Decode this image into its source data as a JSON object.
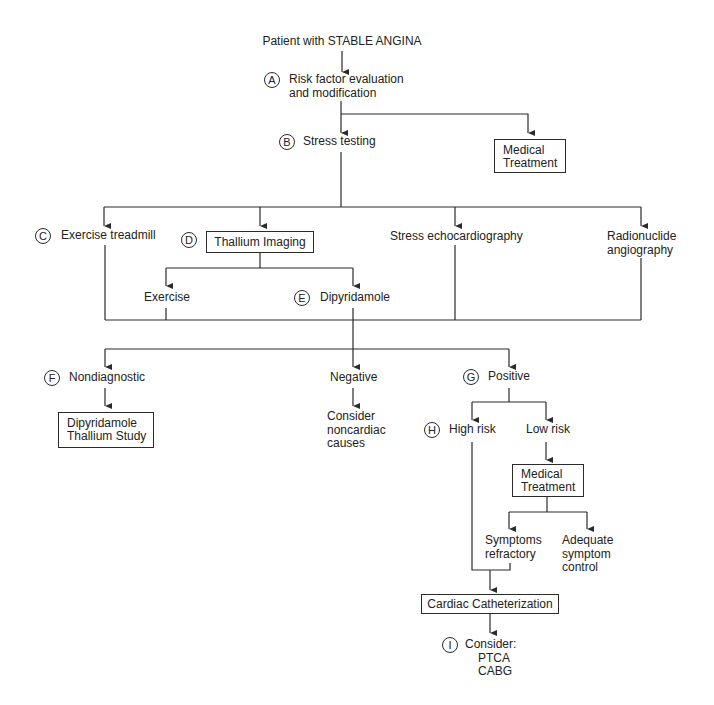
{
  "title": "Patient with STABLE ANGINA",
  "nodes": {
    "a": {
      "marker": "A",
      "label": "Risk factor evaluation\nand modification"
    },
    "medical_treatment_1": {
      "label": "Medical\nTreatment"
    },
    "b": {
      "marker": "B",
      "label": "Stress testing"
    },
    "c": {
      "marker": "C",
      "label": "Exercise treadmill"
    },
    "d": {
      "marker": "D",
      "label": "Thallium Imaging"
    },
    "stress_echo": {
      "label": "Stress echocardiography"
    },
    "radionuclide": {
      "label": "Radionuclide\nangiography"
    },
    "exercise": {
      "label": "Exercise"
    },
    "e": {
      "marker": "E",
      "label": "Dipyridamole"
    },
    "f": {
      "marker": "F",
      "label": "Nondiagnostic"
    },
    "dipyridamole_study": {
      "label": "Dipyridamole\nThallium Study"
    },
    "negative": {
      "label": "Negative"
    },
    "noncardiac": {
      "label": "Consider\nnoncardiac\ncauses"
    },
    "g": {
      "marker": "G",
      "label": "Positive"
    },
    "h": {
      "marker": "H",
      "label": "High risk"
    },
    "low_risk": {
      "label": "Low risk"
    },
    "medical_treatment_2": {
      "label": "Medical\nTreatment"
    },
    "symptoms_refractory": {
      "label": "Symptoms\nrefractory"
    },
    "adequate_control": {
      "label": "Adequate\nsymptom\ncontrol"
    },
    "cardiac_cath": {
      "label": "Cardiac Catheterization"
    },
    "i": {
      "marker": "I",
      "label": "Consider:",
      "options": [
        "PTCA",
        "CABG"
      ]
    }
  }
}
